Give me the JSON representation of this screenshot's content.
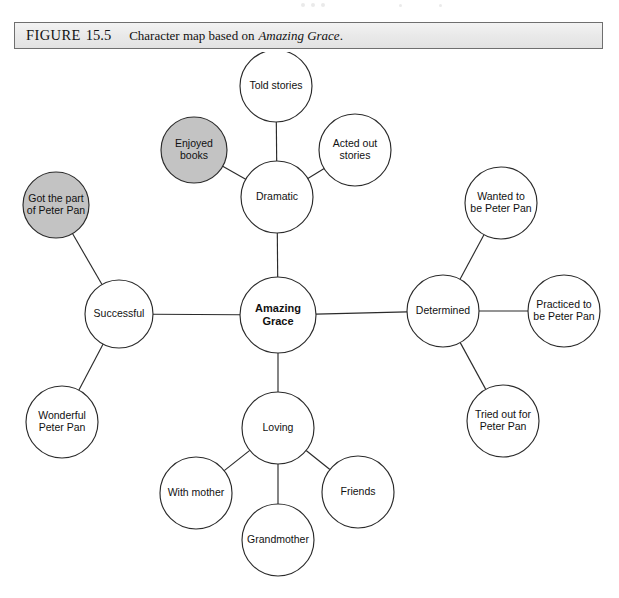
{
  "figure": {
    "label": "FIGURE",
    "number": "15.5",
    "caption_text": "Character map based on",
    "caption_title": "Amazing Grace",
    "caption_period": ".",
    "full_caption": "FIGURE 15.5  Character map based on Amazing Grace."
  },
  "colors": {
    "node_fill": "#ffffff",
    "node_shaded_fill": "#c3c3c3",
    "stroke": "#2b2b2b",
    "caption_bar_fill": "#eaeaea",
    "text": "#111111"
  },
  "chart_data": {
    "type": "diagram",
    "subtype": "character-map",
    "title": "Character map based on Amazing Grace",
    "center": "Amazing Grace",
    "nodes": [
      {
        "id": "amazing-grace",
        "label": "Amazing Grace",
        "lines": [
          "Amazing",
          "Grace"
        ],
        "cx": 278,
        "cy": 263,
        "r": 38,
        "shaded": false,
        "bold": true
      },
      {
        "id": "dramatic",
        "label": "Dramatic",
        "lines": [
          "Dramatic"
        ],
        "cx": 277,
        "cy": 145,
        "r": 36,
        "shaded": false,
        "bold": false
      },
      {
        "id": "told-stories",
        "label": "Told stories",
        "lines": [
          "Told stories"
        ],
        "cx": 276,
        "cy": 34,
        "r": 36,
        "shaded": false,
        "bold": false
      },
      {
        "id": "acted-out-stories",
        "label": "Acted out stories",
        "lines": [
          "Acted out",
          "stories"
        ],
        "cx": 355,
        "cy": 98,
        "r": 36,
        "shaded": false,
        "bold": false
      },
      {
        "id": "enjoyed-books",
        "label": "Enjoyed books",
        "lines": [
          "Enjoyed",
          "books"
        ],
        "cx": 194,
        "cy": 98,
        "r": 33,
        "shaded": true,
        "bold": false
      },
      {
        "id": "successful",
        "label": "Successful",
        "lines": [
          "Successful"
        ],
        "cx": 119,
        "cy": 262,
        "r": 34,
        "shaded": false,
        "bold": false
      },
      {
        "id": "got-the-part-of-peter-pan",
        "label": "Got the part of Peter Pan",
        "lines": [
          "Got the part",
          "of Peter Pan"
        ],
        "cx": 56,
        "cy": 153,
        "r": 33,
        "shaded": true,
        "bold": false
      },
      {
        "id": "wonderful-peter-pan",
        "label": "Wonderful Peter Pan",
        "lines": [
          "Wonderful",
          "Peter Pan"
        ],
        "cx": 62,
        "cy": 370,
        "r": 36,
        "shaded": false,
        "bold": false
      },
      {
        "id": "determined",
        "label": "Determined",
        "lines": [
          "Determined"
        ],
        "cx": 443,
        "cy": 259,
        "r": 36,
        "shaded": false,
        "bold": false
      },
      {
        "id": "wanted-to-be-peter-pan",
        "label": "Wanted to be Peter Pan",
        "lines": [
          "Wanted to",
          "be Peter Pan"
        ],
        "cx": 501,
        "cy": 151,
        "r": 36,
        "shaded": false,
        "bold": false
      },
      {
        "id": "practiced-to-be-peter-pan",
        "label": "Practiced to be Peter Pan",
        "lines": [
          "Practiced to",
          "be Peter Pan"
        ],
        "cx": 564,
        "cy": 259,
        "r": 36,
        "shaded": false,
        "bold": false
      },
      {
        "id": "tried-out-for-peter-pan",
        "label": "Tried out for Peter Pan",
        "lines": [
          "Tried out for",
          "Peter Pan"
        ],
        "cx": 503,
        "cy": 369,
        "r": 36,
        "shaded": false,
        "bold": false
      },
      {
        "id": "loving",
        "label": "Loving",
        "lines": [
          "Loving"
        ],
        "cx": 278,
        "cy": 376,
        "r": 36,
        "shaded": false,
        "bold": false
      },
      {
        "id": "with-mother",
        "label": "With mother",
        "lines": [
          "With mother"
        ],
        "cx": 196,
        "cy": 441,
        "r": 36,
        "shaded": false,
        "bold": false
      },
      {
        "id": "grandmother",
        "label": "Grandmother",
        "lines": [
          "Grandmother"
        ],
        "cx": 278,
        "cy": 488,
        "r": 36,
        "shaded": false,
        "bold": false
      },
      {
        "id": "friends",
        "label": "Friends",
        "lines": [
          "Friends"
        ],
        "cx": 358,
        "cy": 440,
        "r": 36,
        "shaded": false,
        "bold": false
      }
    ],
    "edges": [
      {
        "from": "amazing-grace",
        "to": "dramatic"
      },
      {
        "from": "amazing-grace",
        "to": "successful"
      },
      {
        "from": "amazing-grace",
        "to": "determined"
      },
      {
        "from": "amazing-grace",
        "to": "loving"
      },
      {
        "from": "dramatic",
        "to": "told-stories"
      },
      {
        "from": "dramatic",
        "to": "acted-out-stories"
      },
      {
        "from": "dramatic",
        "to": "enjoyed-books"
      },
      {
        "from": "successful",
        "to": "got-the-part-of-peter-pan"
      },
      {
        "from": "successful",
        "to": "wonderful-peter-pan"
      },
      {
        "from": "determined",
        "to": "wanted-to-be-peter-pan"
      },
      {
        "from": "determined",
        "to": "practiced-to-be-peter-pan"
      },
      {
        "from": "determined",
        "to": "tried-out-for-peter-pan"
      },
      {
        "from": "loving",
        "to": "with-mother"
      },
      {
        "from": "loving",
        "to": "grandmother"
      },
      {
        "from": "loving",
        "to": "friends"
      }
    ]
  }
}
